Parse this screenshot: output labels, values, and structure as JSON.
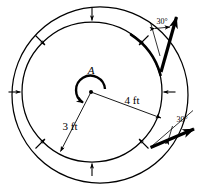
{
  "figure": {
    "point_label": "A",
    "dimensions": {
      "inner_radius": "3 ft",
      "outer_radius": "4 ft"
    },
    "angles": {
      "upper": "30°",
      "lower": "30°"
    },
    "colors": {
      "stroke": "#000000",
      "background": "#ffffff",
      "thick_force": "#000000"
    },
    "geometry": {
      "outer_circle": {
        "cx": 100,
        "cy": 95,
        "r": 88
      },
      "inner_circle": {
        "cx": 92,
        "cy": 92,
        "r": 70
      },
      "center_point": {
        "cx": 91,
        "cy": 92
      },
      "inner_radius_end": {
        "x": 59,
        "y": 153
      },
      "outer_radius_end": {
        "x": 162,
        "y": 119
      },
      "tangent_point": {
        "x": 156,
        "y": 147
      }
    },
    "radial_arrows_count": 8,
    "moment_sense": "counterclockwise",
    "force_arrows": [
      {
        "name": "upper-cable-force",
        "angle_label": "30°"
      },
      {
        "name": "lower-cable-force",
        "angle_label": "30°"
      }
    ]
  }
}
